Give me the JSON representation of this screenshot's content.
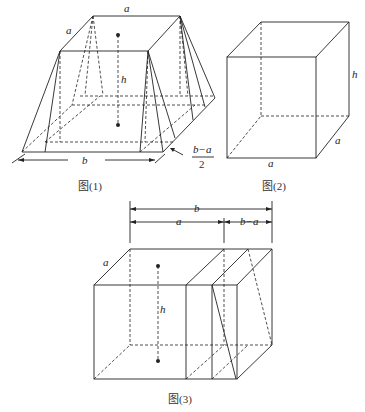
{
  "figures": [
    {
      "id": "fig1",
      "caption": "图(1)",
      "labels": {
        "top": "a",
        "side": "a",
        "height": "h",
        "base": "b",
        "offset_num": "b−a",
        "offset_den": "2"
      }
    },
    {
      "id": "fig2",
      "caption": "图(2)",
      "labels": {
        "height": "h",
        "depth": "a",
        "width": "a"
      }
    },
    {
      "id": "fig3",
      "caption": "图(3)",
      "labels": {
        "total": "b",
        "part_a": "a",
        "part_ba": "b−a",
        "side": "a",
        "height": "h"
      }
    }
  ]
}
